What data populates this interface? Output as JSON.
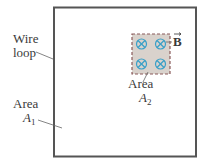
{
  "labels": {
    "wire_loop_line1": "Wire",
    "wire_loop_line2": "loop",
    "area1_word": "Area",
    "area1_symbol": "A",
    "area1_sub": "1",
    "area2_word": "Area",
    "area2_symbol": "A",
    "area2_sub": "2",
    "field": "B"
  },
  "colors": {
    "loop": "#555555",
    "field_region_fill": "#d9d2cc",
    "field_region_border": "#8a5a5a",
    "field_symbol": "#3aa0c8"
  },
  "field_symbols": [
    {
      "cx": 141,
      "cy": 44,
      "type": "into-page"
    },
    {
      "cx": 160,
      "cy": 44,
      "type": "into-page"
    },
    {
      "cx": 141,
      "cy": 64,
      "type": "into-page"
    },
    {
      "cx": 160,
      "cy": 64,
      "type": "into-page"
    }
  ]
}
